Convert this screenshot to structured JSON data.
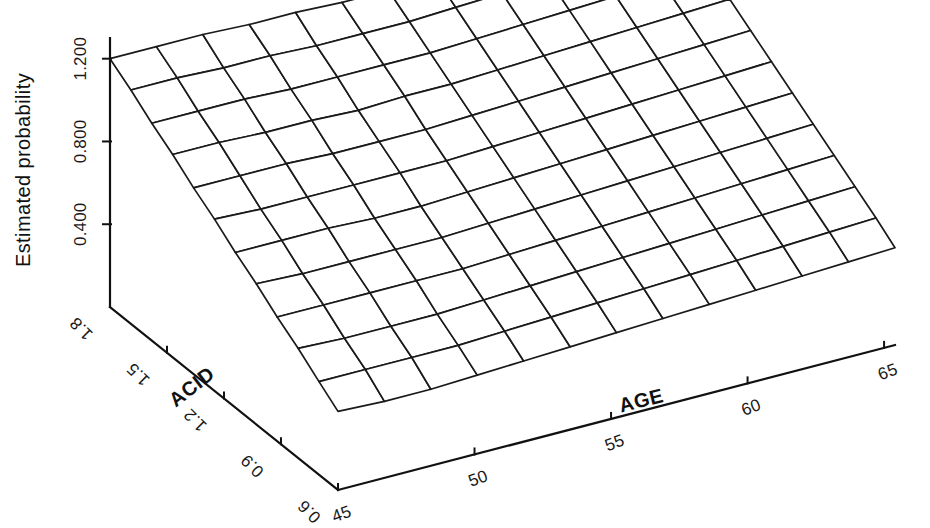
{
  "figure": {
    "background_color": "#ffffff",
    "line_color": "#1a1a1a",
    "surface_fill": "#ffffff"
  },
  "axes": {
    "z": {
      "title": "Estimated probability",
      "ticks": [
        "0.400",
        "0.800",
        "1.200"
      ],
      "tick_values": [
        0.4,
        0.8,
        1.2
      ]
    },
    "x": {
      "title": "AGE",
      "ticks": [
        "45",
        "50",
        "55",
        "60",
        "65"
      ],
      "tick_values": [
        45,
        50,
        55,
        60,
        65
      ]
    },
    "y": {
      "title": "ACID",
      "ticks": [
        "1.8",
        "1.5",
        "1.2",
        "0.9",
        "0.6"
      ],
      "tick_values": [
        1.8,
        1.5,
        1.2,
        0.9,
        0.6
      ]
    }
  },
  "chart_data": {
    "type": "surface",
    "title": "",
    "xlabel": "AGE",
    "ylabel": "ACID",
    "zlabel": "Estimated probability",
    "xlim": [
      44,
      67
    ],
    "ylim": [
      0.5,
      1.9
    ],
    "zlim": [
      0.0,
      1.3
    ],
    "grid": true,
    "legend": "none",
    "x": [
      45,
      46.7,
      48.4,
      50.1,
      51.8,
      53.5,
      55.2,
      56.9,
      58.6,
      60.3,
      62.0,
      63.7,
      65.4
    ],
    "y": [
      1.8,
      1.69,
      1.58,
      1.47,
      1.36,
      1.25,
      1.14,
      1.03,
      0.92,
      0.81,
      0.7,
      0.6
    ],
    "z_note": "Wireframe surface, highest along the ACID=1.8 back edge (approx 1.20) and sloping down toward the AGE=45 / ACID=0.6 front corner (approx 0.30); a shallow ripple runs across the mid-surface.",
    "z": [
      [
        1.2,
        1.2,
        1.2,
        1.19,
        1.19,
        1.18,
        1.18,
        1.19,
        1.2,
        1.21,
        1.22,
        1.23,
        1.24
      ],
      [
        1.13,
        1.13,
        1.12,
        1.12,
        1.11,
        1.11,
        1.11,
        1.12,
        1.13,
        1.14,
        1.15,
        1.16,
        1.17
      ],
      [
        1.05,
        1.05,
        1.05,
        1.04,
        1.04,
        1.04,
        1.04,
        1.05,
        1.06,
        1.07,
        1.08,
        1.09,
        1.1
      ],
      [
        0.98,
        0.98,
        0.97,
        0.97,
        0.96,
        0.97,
        0.97,
        0.98,
        0.99,
        1.0,
        1.01,
        1.02,
        1.03
      ],
      [
        0.9,
        0.9,
        0.9,
        0.89,
        0.89,
        0.89,
        0.9,
        0.91,
        0.92,
        0.93,
        0.94,
        0.95,
        0.96
      ],
      [
        0.83,
        0.82,
        0.82,
        0.82,
        0.82,
        0.82,
        0.83,
        0.84,
        0.85,
        0.86,
        0.87,
        0.88,
        0.89
      ],
      [
        0.75,
        0.75,
        0.75,
        0.74,
        0.74,
        0.75,
        0.76,
        0.77,
        0.78,
        0.79,
        0.8,
        0.81,
        0.82
      ],
      [
        0.68,
        0.67,
        0.67,
        0.67,
        0.67,
        0.68,
        0.69,
        0.7,
        0.71,
        0.72,
        0.73,
        0.74,
        0.75
      ],
      [
        0.6,
        0.6,
        0.6,
        0.6,
        0.6,
        0.61,
        0.62,
        0.63,
        0.64,
        0.65,
        0.66,
        0.67,
        0.68
      ],
      [
        0.53,
        0.52,
        0.52,
        0.52,
        0.53,
        0.54,
        0.55,
        0.56,
        0.57,
        0.58,
        0.59,
        0.6,
        0.61
      ],
      [
        0.45,
        0.45,
        0.45,
        0.45,
        0.46,
        0.47,
        0.48,
        0.49,
        0.5,
        0.51,
        0.52,
        0.53,
        0.54
      ],
      [
        0.38,
        0.37,
        0.37,
        0.38,
        0.39,
        0.4,
        0.41,
        0.42,
        0.43,
        0.44,
        0.45,
        0.46,
        0.47
      ]
    ]
  }
}
